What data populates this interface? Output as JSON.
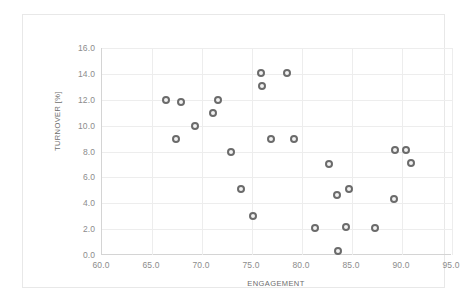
{
  "chart_data": {
    "type": "scatter",
    "title": "",
    "xlabel": "ENGAGEMENT",
    "ylabel": "TURNOVER [%]",
    "xlim": [
      60.0,
      95.0
    ],
    "ylim": [
      0.0,
      16.0
    ],
    "xticks": [
      "60.0",
      "65.0",
      "70.0",
      "75.0",
      "80.0",
      "85.0",
      "90.0",
      "95.0"
    ],
    "xtick_values": [
      60.0,
      65.0,
      70.0,
      75.0,
      80.0,
      85.0,
      90.0,
      95.0
    ],
    "yticks": [
      "0.0",
      "2.0",
      "4.0",
      "6.0",
      "8.0",
      "10.0",
      "12.0",
      "14.0",
      "16.0"
    ],
    "ytick_values": [
      0.0,
      2.0,
      4.0,
      6.0,
      8.0,
      10.0,
      12.0,
      14.0,
      16.0
    ],
    "grid": true,
    "legend": false,
    "marker_color": "#6b6b6b",
    "marker_fill": "#f2f2f2",
    "gridline_color": "#ededed",
    "axis_color": "#d4d4d4",
    "series": [
      {
        "name": "Employees",
        "points": [
          {
            "x": 66.4,
            "y": 12.0
          },
          {
            "x": 67.4,
            "y": 9.0
          },
          {
            "x": 67.9,
            "y": 11.8
          },
          {
            "x": 69.3,
            "y": 10.0
          },
          {
            "x": 71.1,
            "y": 11.0
          },
          {
            "x": 71.6,
            "y": 12.0
          },
          {
            "x": 72.9,
            "y": 8.0
          },
          {
            "x": 73.9,
            "y": 5.1
          },
          {
            "x": 75.1,
            "y": 3.0
          },
          {
            "x": 75.9,
            "y": 14.1
          },
          {
            "x": 76.0,
            "y": 13.1
          },
          {
            "x": 76.9,
            "y": 9.0
          },
          {
            "x": 78.5,
            "y": 14.1
          },
          {
            "x": 79.2,
            "y": 9.0
          },
          {
            "x": 81.3,
            "y": 2.1
          },
          {
            "x": 82.7,
            "y": 7.0
          },
          {
            "x": 83.5,
            "y": 4.6
          },
          {
            "x": 83.6,
            "y": 0.3
          },
          {
            "x": 84.4,
            "y": 2.2
          },
          {
            "x": 84.7,
            "y": 5.1
          },
          {
            "x": 87.3,
            "y": 2.1
          },
          {
            "x": 89.2,
            "y": 4.3
          },
          {
            "x": 89.3,
            "y": 8.1
          },
          {
            "x": 90.4,
            "y": 8.1
          },
          {
            "x": 90.9,
            "y": 7.1
          }
        ]
      }
    ]
  }
}
